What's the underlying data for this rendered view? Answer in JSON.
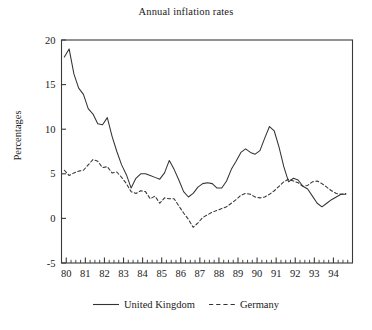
{
  "chart_data": {
    "type": "line",
    "title": "Annual inflation rates",
    "xlabel": "",
    "ylabel": "Percentages",
    "xlim": [
      79.75,
      95.0
    ],
    "ylim": [
      -5,
      20
    ],
    "yticks": [
      -5,
      0,
      5,
      10,
      15,
      20
    ],
    "ytick_labels": [
      "-5",
      "0",
      "5",
      "10",
      "15",
      "20"
    ],
    "xticks": [
      80,
      81,
      82,
      83,
      84,
      85,
      86,
      87,
      88,
      89,
      90,
      91,
      92,
      93,
      94
    ],
    "xtick_labels": [
      "80",
      "81",
      "82",
      "83",
      "84",
      "85",
      "86",
      "87",
      "88",
      "89",
      "90",
      "91",
      "92",
      "93",
      "94"
    ],
    "x_minor_interval": 0.25,
    "grid": false,
    "legend_position": "below",
    "frame": true,
    "x": [
      79.9,
      80.15,
      80.4,
      80.65,
      80.9,
      81.15,
      81.4,
      81.65,
      81.9,
      82.15,
      82.4,
      82.65,
      82.9,
      83.15,
      83.4,
      83.65,
      83.9,
      84.15,
      84.4,
      84.65,
      84.9,
      85.15,
      85.4,
      85.65,
      85.9,
      86.15,
      86.4,
      86.65,
      86.9,
      87.15,
      87.4,
      87.65,
      87.9,
      88.15,
      88.4,
      88.65,
      88.9,
      89.15,
      89.4,
      89.65,
      89.9,
      90.15,
      90.4,
      90.65,
      90.9,
      91.15,
      91.4,
      91.65,
      91.9,
      92.15,
      92.4,
      92.65,
      92.9,
      93.15,
      93.4,
      93.65,
      93.9,
      94.15,
      94.4,
      94.65
    ],
    "series": [
      {
        "name": "United Kingdom",
        "style": "solid",
        "color": "#333333",
        "values": [
          18.1,
          19.0,
          16.2,
          14.6,
          13.9,
          12.3,
          11.7,
          10.6,
          10.5,
          11.3,
          9.2,
          7.5,
          6.0,
          4.9,
          3.4,
          4.5,
          5.0,
          5.0,
          4.8,
          4.6,
          4.4,
          5.1,
          6.5,
          5.5,
          4.3,
          3.0,
          2.4,
          2.8,
          3.5,
          3.9,
          4.0,
          3.9,
          3.4,
          3.4,
          4.2,
          5.5,
          6.4,
          7.4,
          7.8,
          7.4,
          7.2,
          7.6,
          9.0,
          10.3,
          9.8,
          8.0,
          5.8,
          4.1,
          4.5,
          4.3,
          3.6,
          3.3,
          2.5,
          1.7,
          1.3,
          1.7,
          2.1,
          2.4,
          2.7,
          2.7
        ]
      },
      {
        "name": "Germany",
        "style": "dashed",
        "color": "#333333",
        "values": [
          5.4,
          4.8,
          5.1,
          5.3,
          5.4,
          6.0,
          6.6,
          6.4,
          5.7,
          5.8,
          5.1,
          5.2,
          4.6,
          3.9,
          3.0,
          2.8,
          3.1,
          3.0,
          2.2,
          2.5,
          1.7,
          2.3,
          2.2,
          2.2,
          1.4,
          0.6,
          -0.1,
          -1.0,
          -0.5,
          0.1,
          0.4,
          0.7,
          0.9,
          1.1,
          1.3,
          1.7,
          2.1,
          2.6,
          2.8,
          2.7,
          2.4,
          2.3,
          2.4,
          2.7,
          3.1,
          3.6,
          4.1,
          4.4,
          4.2,
          4.0,
          3.6,
          3.7,
          4.1,
          4.2,
          3.9,
          3.5,
          3.1,
          2.8,
          2.7,
          2.8
        ]
      }
    ]
  },
  "legend": {
    "entries": [
      {
        "label": "United Kingdom",
        "style": "solid"
      },
      {
        "label": "Germany",
        "style": "dashed"
      }
    ]
  }
}
